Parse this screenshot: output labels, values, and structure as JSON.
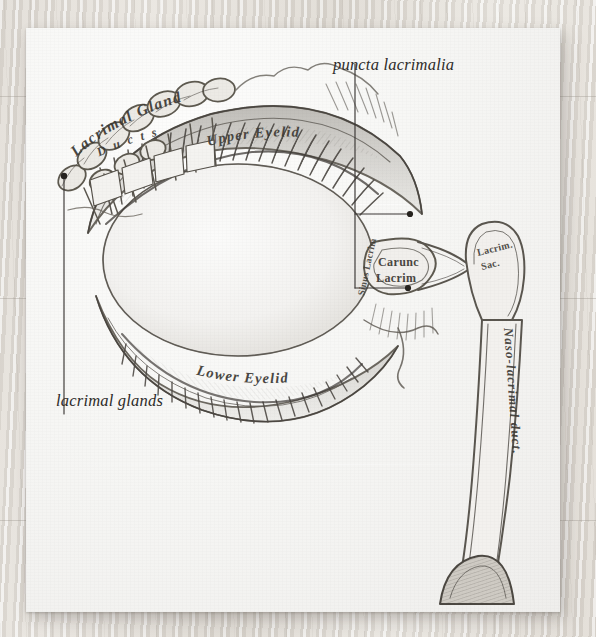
{
  "scene": {
    "surface": "wood-desk",
    "paper_color": "#f6f6f4",
    "ink_color": "#6f6b64"
  },
  "plate": {
    "title": "lacrimal apparatus engraving",
    "engraved_labels": [
      {
        "id": "lacrimal-gland",
        "text": "Lacrimal Gland",
        "style": "engraved-script"
      },
      {
        "id": "ducts",
        "text": "Ducts",
        "style": "engraved-spaced"
      },
      {
        "id": "upper-eyelid",
        "text": "Upper Eyelid",
        "style": "engraved-curved"
      },
      {
        "id": "lower-eyelid",
        "text": "Lower Eyelid",
        "style": "engraved-curved"
      },
      {
        "id": "caruncula-lacrimalis",
        "text": "Carunc Lacrim",
        "style": "engraved"
      },
      {
        "id": "sinus-lacrimalis",
        "text": "Sinus Lacrim",
        "style": "engraved-vertical"
      },
      {
        "id": "lacrimal-sac",
        "text": "Lacrim. Sac.",
        "style": "engraved"
      },
      {
        "id": "nasolacrimal-duct",
        "text": "Naso-lacrimal duct.",
        "style": "engraved-vertical"
      }
    ]
  },
  "annotations": [
    {
      "id": "puncta-lacrimalia",
      "text": "puncta lacrimalia",
      "leader": "bracket-two-points"
    },
    {
      "id": "lacrimal-glands",
      "text": "lacrimal glands",
      "leader": "single-vertical"
    }
  ]
}
